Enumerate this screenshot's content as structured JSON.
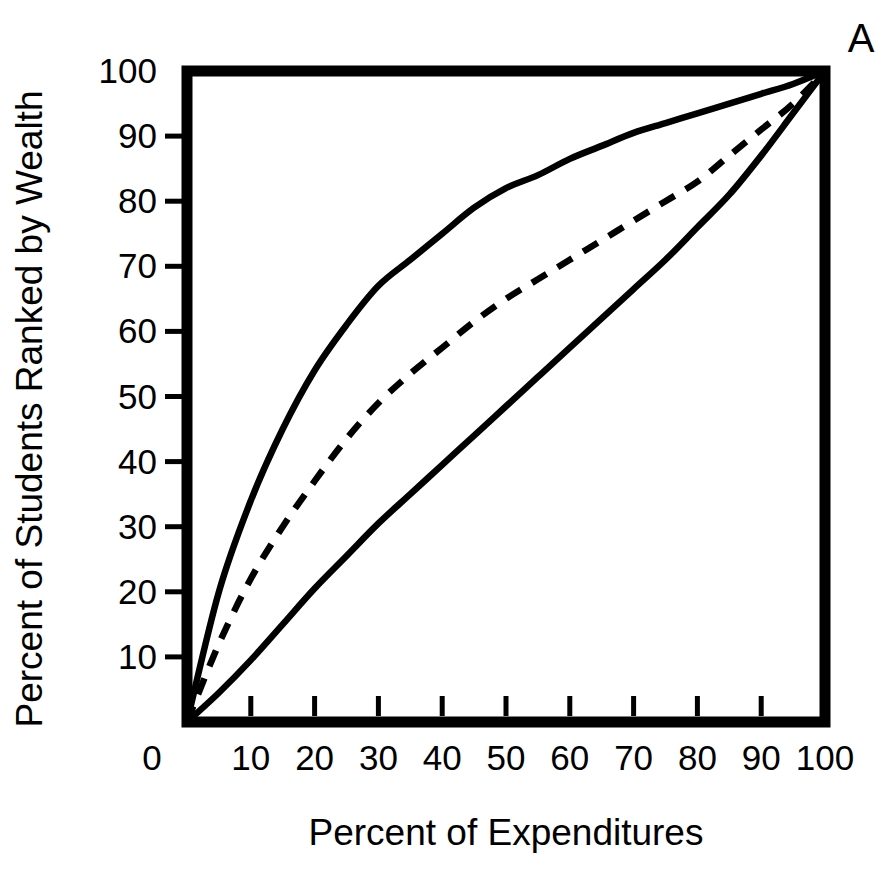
{
  "chart_data": {
    "type": "line",
    "title": "",
    "panel_label": "A",
    "xlabel": "Percent of Expenditures",
    "ylabel": "Percent of Students Ranked by Wealth",
    "xlim": [
      0,
      100
    ],
    "ylim": [
      0,
      100
    ],
    "xticks": [
      0,
      10,
      20,
      30,
      40,
      50,
      60,
      70,
      80,
      90,
      100
    ],
    "yticks": [
      10,
      20,
      30,
      40,
      50,
      60,
      70,
      80,
      90,
      100
    ],
    "xtick_labels": [
      "0",
      "10",
      "20",
      "30",
      "40",
      "50",
      "60",
      "70",
      "80",
      "90",
      "100"
    ],
    "ytick_labels": [
      "10",
      "20",
      "30",
      "40",
      "50",
      "60",
      "70",
      "80",
      "90",
      "100"
    ],
    "grid": false,
    "legend": "none",
    "line_color": "#000000",
    "background_color": "#ffffff",
    "series": [
      {
        "name": "upper-curve",
        "style": "solid",
        "x": [
          0,
          5,
          10,
          15,
          20,
          25,
          30,
          35,
          40,
          45,
          50,
          55,
          60,
          65,
          70,
          75,
          80,
          85,
          90,
          95,
          100
        ],
        "y": [
          0,
          20,
          34,
          45,
          54,
          61,
          67,
          71,
          75,
          79,
          82,
          84,
          86.5,
          88.5,
          90.5,
          92,
          93.5,
          95,
          96.5,
          98,
          100
        ]
      },
      {
        "name": "middle-curve",
        "style": "dashed",
        "x": [
          0,
          5,
          10,
          15,
          20,
          25,
          30,
          35,
          40,
          45,
          50,
          55,
          60,
          65,
          70,
          75,
          80,
          85,
          90,
          95,
          100
        ],
        "y": [
          0,
          12,
          22,
          30,
          37,
          43.5,
          49,
          53.5,
          57.5,
          61.5,
          65,
          68,
          71,
          74,
          77,
          80,
          83,
          87,
          91,
          95,
          100
        ]
      },
      {
        "name": "lower-curve",
        "style": "solid",
        "x": [
          0,
          5,
          10,
          15,
          20,
          25,
          30,
          35,
          40,
          45,
          50,
          55,
          60,
          65,
          70,
          75,
          80,
          85,
          90,
          95,
          100
        ],
        "y": [
          0,
          4.5,
          9.5,
          15,
          20.5,
          25.5,
          30.5,
          35,
          39.5,
          44,
          48.5,
          53,
          57.5,
          62,
          66.5,
          71,
          76,
          81,
          87,
          93.5,
          100
        ]
      }
    ]
  }
}
